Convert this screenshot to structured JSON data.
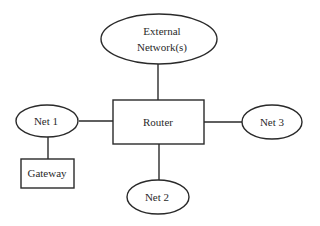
{
  "diagram": {
    "type": "network-topology",
    "nodes": [
      {
        "id": "external",
        "shape": "ellipse",
        "label_lines": [
          "External",
          "Network(s)"
        ]
      },
      {
        "id": "router",
        "shape": "rectangle",
        "label": "Router"
      },
      {
        "id": "net1",
        "shape": "ellipse",
        "label": "Net 1"
      },
      {
        "id": "net2",
        "shape": "ellipse",
        "label": "Net 2"
      },
      {
        "id": "net3",
        "shape": "ellipse",
        "label": "Net 3"
      },
      {
        "id": "gateway",
        "shape": "rectangle",
        "label": "Gateway"
      }
    ],
    "edges": [
      {
        "from": "external",
        "to": "router"
      },
      {
        "from": "net1",
        "to": "router"
      },
      {
        "from": "router",
        "to": "net3"
      },
      {
        "from": "router",
        "to": "net2"
      },
      {
        "from": "net1",
        "to": "gateway"
      }
    ]
  },
  "labels": {
    "external_line1": "External",
    "external_line2": "Network(s)",
    "router": "Router",
    "net1": "Net 1",
    "net2": "Net 2",
    "net3": "Net 3",
    "gateway": "Gateway"
  }
}
